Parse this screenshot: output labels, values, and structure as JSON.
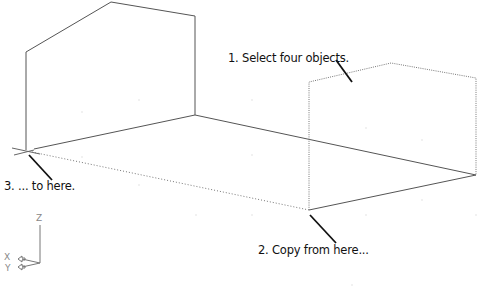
{
  "callouts": [
    {
      "id": "select",
      "text": "1. Select four objects."
    },
    {
      "id": "copy_from",
      "text": "2. Copy from here..."
    },
    {
      "id": "to_here",
      "text": "3. ... to here."
    }
  ],
  "ucs_icon": {
    "z": "Z",
    "x": "X",
    "y": "Y"
  },
  "colors": {
    "line": "#555555",
    "leader": "#111111",
    "dotted": "#777777",
    "text": "#111111"
  }
}
